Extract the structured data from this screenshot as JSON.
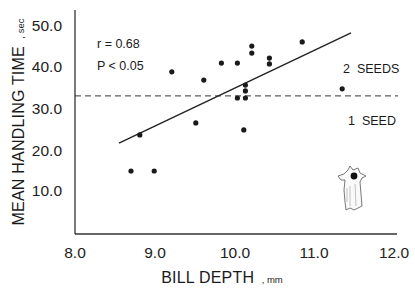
{
  "chart_data": {
    "type": "scatter",
    "title": "",
    "xlabel": "BILL DEPTH",
    "xlabel_unit": "mm",
    "ylabel": "MEAN HANDLING TIME",
    "ylabel_unit": "sec",
    "xlim": [
      8.0,
      12.0
    ],
    "ylim": [
      0,
      50.0
    ],
    "x_ticks": [
      "8.0",
      "9.0",
      "10.0",
      "11.0",
      "12.0"
    ],
    "y_ticks": [
      "10.0",
      "20.0",
      "30.0",
      "40.0",
      "50.0"
    ],
    "grid": false,
    "legend": null,
    "series": [
      {
        "name": "observations",
        "points": [
          {
            "x": 8.7,
            "y": 14.7
          },
          {
            "x": 8.99,
            "y": 14.7
          },
          {
            "x": 8.81,
            "y": 23.4
          },
          {
            "x": 9.21,
            "y": 38.6
          },
          {
            "x": 9.51,
            "y": 26.3
          },
          {
            "x": 9.61,
            "y": 36.6
          },
          {
            "x": 9.83,
            "y": 40.7
          },
          {
            "x": 10.03,
            "y": 40.7
          },
          {
            "x": 10.03,
            "y": 32.3
          },
          {
            "x": 10.13,
            "y": 32.3
          },
          {
            "x": 10.13,
            "y": 34.0
          },
          {
            "x": 10.13,
            "y": 35.4
          },
          {
            "x": 10.11,
            "y": 24.6
          },
          {
            "x": 10.21,
            "y": 44.8
          },
          {
            "x": 10.21,
            "y": 43.1
          },
          {
            "x": 10.43,
            "y": 41.9
          },
          {
            "x": 10.43,
            "y": 40.5
          },
          {
            "x": 10.84,
            "y": 45.8
          },
          {
            "x": 11.34,
            "y": 34.5
          }
        ]
      }
    ],
    "regression_line": {
      "x1": 8.55,
      "y1": 21.4,
      "x2": 11.45,
      "y2": 48.0
    },
    "threshold_line": {
      "y": 32.8,
      "style": "dashed",
      "x1": 8.0,
      "x2": 12.0
    },
    "annotations": {
      "r": "r = 0.68",
      "p": "P < 0.05",
      "above_threshold": "2  SEEDS",
      "below_threshold": "1  SEED"
    },
    "illustration": "bird-holding-seed"
  },
  "labels": {
    "x_title": "BILL  DEPTH",
    "x_unit": ", mm",
    "y_title": "MEAN  HANDLING  TIME",
    "y_unit": ", sec"
  },
  "colors": {
    "ink": "#1a1a1a",
    "background": "#ffffff"
  }
}
